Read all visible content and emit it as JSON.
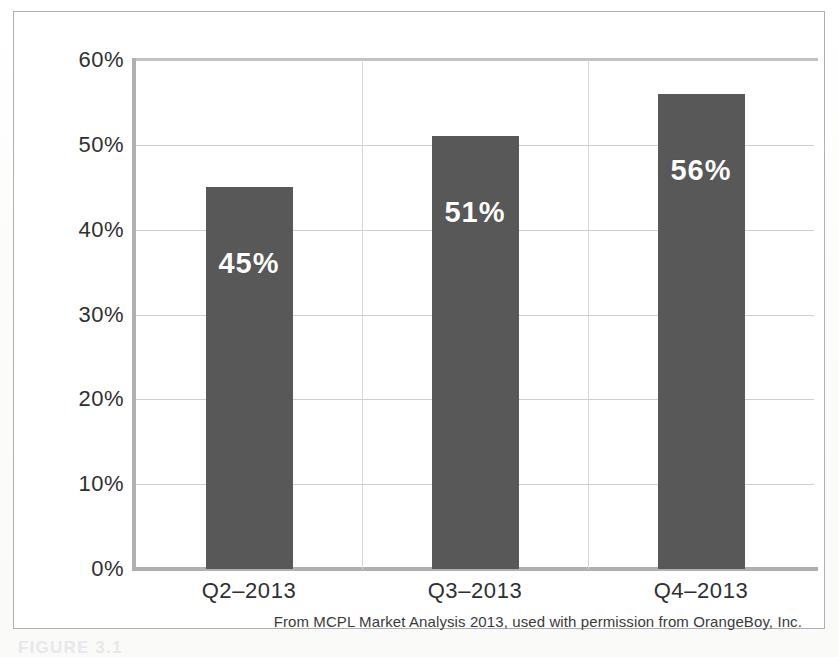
{
  "figure": {
    "source_caption": "From MCPL Market Analysis 2013, used with permission from OrangeBoy, Inc.",
    "caption_label": "FIGURE 3.1",
    "bar_color": "#585858",
    "axis_color": "#b0b0b3",
    "grid_color": "#cfcfd2",
    "value_label_color": "#ffffff"
  },
  "chart_data": {
    "type": "bar",
    "title": "",
    "xlabel": "",
    "ylabel": "",
    "categories": [
      "Q2–2013",
      "Q3–2013",
      "Q4–2013"
    ],
    "values": [
      45,
      51,
      56
    ],
    "value_labels": [
      "45%",
      "51%",
      "56%"
    ],
    "ylim": [
      0,
      60
    ],
    "ytick_values": [
      0,
      10,
      20,
      30,
      40,
      50,
      60
    ],
    "ytick_labels": [
      "0%",
      "10%",
      "20%",
      "30%",
      "40%",
      "50%",
      "60%"
    ],
    "grid": true,
    "grid_axis": "both",
    "legend": false,
    "legend_position": "none",
    "units": "percent"
  }
}
